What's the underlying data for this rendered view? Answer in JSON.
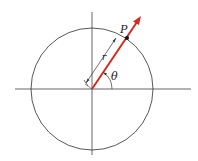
{
  "diagram": {
    "labels": {
      "point": "P",
      "radius": "r",
      "angle": "θ"
    },
    "colors": {
      "ray": "#d42a20",
      "axes": "#555555",
      "circle": "#444444",
      "text": "#222222"
    }
  }
}
